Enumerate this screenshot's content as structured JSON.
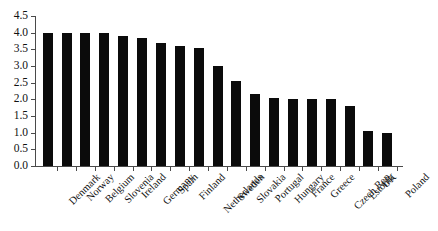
{
  "chart_data": {
    "type": "bar",
    "title": "",
    "subtitle": "",
    "xlabel": "",
    "ylabel": "",
    "ylim": [
      0.0,
      4.5
    ],
    "grid": false,
    "legend": null,
    "legend_position": "none",
    "bar_color": "#0b0b0b",
    "axis_color": "#4a4a4a",
    "ytick_labels": [
      "4.5",
      "4.0",
      "3.5",
      "3.0",
      "2.5",
      "2.0",
      "1.5",
      "1.0",
      "0.5",
      "0.0"
    ],
    "ytick_values": [
      4.5,
      4.0,
      3.5,
      3.0,
      2.5,
      2.0,
      1.5,
      1.0,
      0.5,
      0.0
    ],
    "categories": [
      "Denmark",
      "Norway",
      "Belgium",
      "Slovenia",
      "Ireland",
      "Germany",
      "Spain",
      "Finland",
      "Netherlands",
      "Sweden",
      "Slovakia",
      "Portugal",
      "Hungary",
      "France",
      "Greece",
      "Czech Rep",
      "Estonia",
      "UK",
      "Poland"
    ],
    "values": [
      4.0,
      4.0,
      4.0,
      4.0,
      3.9,
      3.85,
      3.7,
      3.6,
      3.55,
      3.0,
      2.55,
      2.15,
      2.05,
      2.0,
      2.0,
      2.0,
      1.8,
      1.05,
      1.0
    ]
  }
}
